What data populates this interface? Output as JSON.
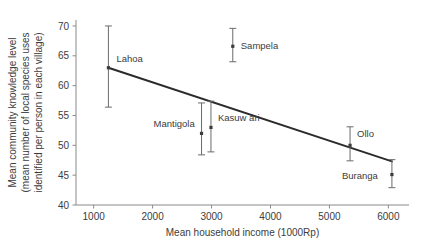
{
  "chart_data": {
    "type": "scatter",
    "title": "",
    "xlabel": "Mean household income (1000Rp)",
    "ylabel_lines": [
      "Mean community knowledge level",
      "(mean number of local species uses",
      "identified per person in each village)"
    ],
    "ylabel": "Mean community knowledge level (mean number of local species uses identified per person in each village)",
    "xlim": [
      700,
      6350
    ],
    "ylim": [
      40,
      71
    ],
    "xticks": [
      1000,
      2000,
      3000,
      4000,
      5000,
      6000
    ],
    "xtick_labels": [
      "1000",
      "2000",
      "3000",
      "4000",
      "5000",
      "6000"
    ],
    "yticks": [
      40,
      45,
      50,
      55,
      60,
      65,
      70
    ],
    "ytick_labels": [
      "40",
      "45",
      "50",
      "55",
      "60",
      "65",
      "70"
    ],
    "grid": false,
    "legend": "none",
    "error_bar_type": "vertical",
    "points": [
      {
        "label": "Lahoa",
        "x": 1250,
        "y": 63.0,
        "y_low": 56.4,
        "y_high": 70.0,
        "label_dx": 8,
        "label_dy": -6
      },
      {
        "label": "Mantigola",
        "x": 2830,
        "y": 52.0,
        "y_low": 48.4,
        "y_high": 57.1,
        "label_dx": -48,
        "label_dy": -6
      },
      {
        "label": "Kasuw ari",
        "x": 2990,
        "y": 53.0,
        "y_low": 48.9,
        "y_high": 57.4,
        "label_dx": 7,
        "label_dy": -6
      },
      {
        "label": "Sampela",
        "x": 3360,
        "y": 66.6,
        "y_low": 64.0,
        "y_high": 69.6,
        "label_dx": 8,
        "label_dy": 3
      },
      {
        "label": "Ollo",
        "x": 5350,
        "y": 50.0,
        "y_low": 47.4,
        "y_high": 53.1,
        "label_dx": 7,
        "label_dy": -8
      },
      {
        "label": "Buranga",
        "x": 6060,
        "y": 45.1,
        "y_low": 42.9,
        "y_high": 47.6,
        "label_dx": -50,
        "label_dy": 4
      }
    ],
    "fit_line": {
      "name": "linear regression fit",
      "x_start": 1250,
      "y_start": 63.0,
      "x_end": 6060,
      "y_end": 47.3
    }
  }
}
